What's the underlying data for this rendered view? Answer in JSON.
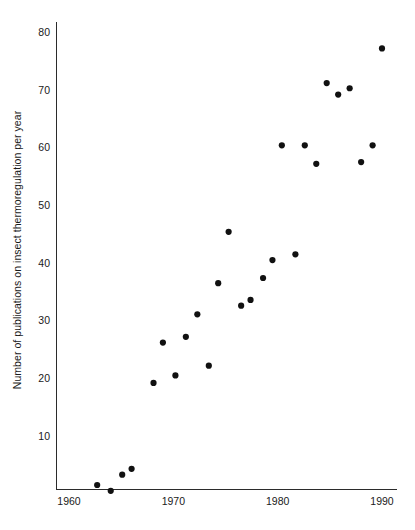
{
  "chart_data": {
    "type": "scatter",
    "title": "",
    "xlabel": "",
    "ylabel": "Number of publications on insect thermoregulation per year",
    "xlim": [
      1960,
      1991
    ],
    "ylim": [
      0,
      82
    ],
    "grid": false,
    "legend": null,
    "xticks": [
      1960,
      1970,
      1980,
      1990
    ],
    "xtick_labels": [
      "1960",
      "1970",
      "1980",
      "1990"
    ],
    "yticks": [
      10,
      20,
      30,
      40,
      50,
      60,
      70,
      80
    ],
    "ytick_labels": [
      "10",
      "20",
      "30",
      "40",
      "50",
      "60",
      "70",
      "80"
    ],
    "marker": "filled-circle",
    "marker_color": "#111111",
    "x": [
      1963,
      1964,
      1965,
      1966,
      1968,
      1969,
      1970,
      1971,
      1972,
      1973,
      1974,
      1975,
      1976,
      1977,
      1978,
      1979,
      1980,
      1981,
      1982,
      1983,
      1984,
      1985,
      1986,
      1987,
      1988,
      1989,
      1990
    ],
    "y": [
      1.5,
      0.5,
      3.3,
      4.3,
      19.2,
      26.2,
      20.5,
      27.2,
      31.1,
      22.2,
      36.5,
      45.4,
      32.6,
      33.6,
      37.4,
      40.5,
      60.4,
      41.5,
      60.4,
      57.2,
      71.2,
      69.2,
      70.3,
      57.5,
      60.4,
      77.2
    ],
    "points": [
      {
        "x": 1962.7,
        "y": 1.5
      },
      {
        "x": 1964.0,
        "y": 0.5
      },
      {
        "x": 1965.1,
        "y": 3.3
      },
      {
        "x": 1966.0,
        "y": 4.3
      },
      {
        "x": 1968.1,
        "y": 19.2
      },
      {
        "x": 1969.0,
        "y": 26.2
      },
      {
        "x": 1970.2,
        "y": 20.5
      },
      {
        "x": 1971.2,
        "y": 27.2
      },
      {
        "x": 1972.3,
        "y": 31.1
      },
      {
        "x": 1973.4,
        "y": 22.2
      },
      {
        "x": 1974.3,
        "y": 36.5
      },
      {
        "x": 1975.3,
        "y": 45.4
      },
      {
        "x": 1976.5,
        "y": 32.6
      },
      {
        "x": 1977.4,
        "y": 33.6
      },
      {
        "x": 1978.6,
        "y": 37.4
      },
      {
        "x": 1979.5,
        "y": 40.5
      },
      {
        "x": 1980.4,
        "y": 60.4
      },
      {
        "x": 1981.7,
        "y": 41.5
      },
      {
        "x": 1982.6,
        "y": 60.4
      },
      {
        "x": 1983.7,
        "y": 57.2
      },
      {
        "x": 1984.7,
        "y": 71.2
      },
      {
        "x": 1985.8,
        "y": 69.2
      },
      {
        "x": 1986.9,
        "y": 70.3
      },
      {
        "x": 1988.0,
        "y": 57.5
      },
      {
        "x": 1989.1,
        "y": 60.4
      },
      {
        "x": 1990.0,
        "y": 77.2
      }
    ]
  },
  "axes": {
    "ylabel_text": "Number of publications on insect thermoregulation per year"
  },
  "colors": {
    "marker": "#111111",
    "axis": "#2b2b2b",
    "text": "#1a1a1a",
    "background": "#ffffff"
  }
}
